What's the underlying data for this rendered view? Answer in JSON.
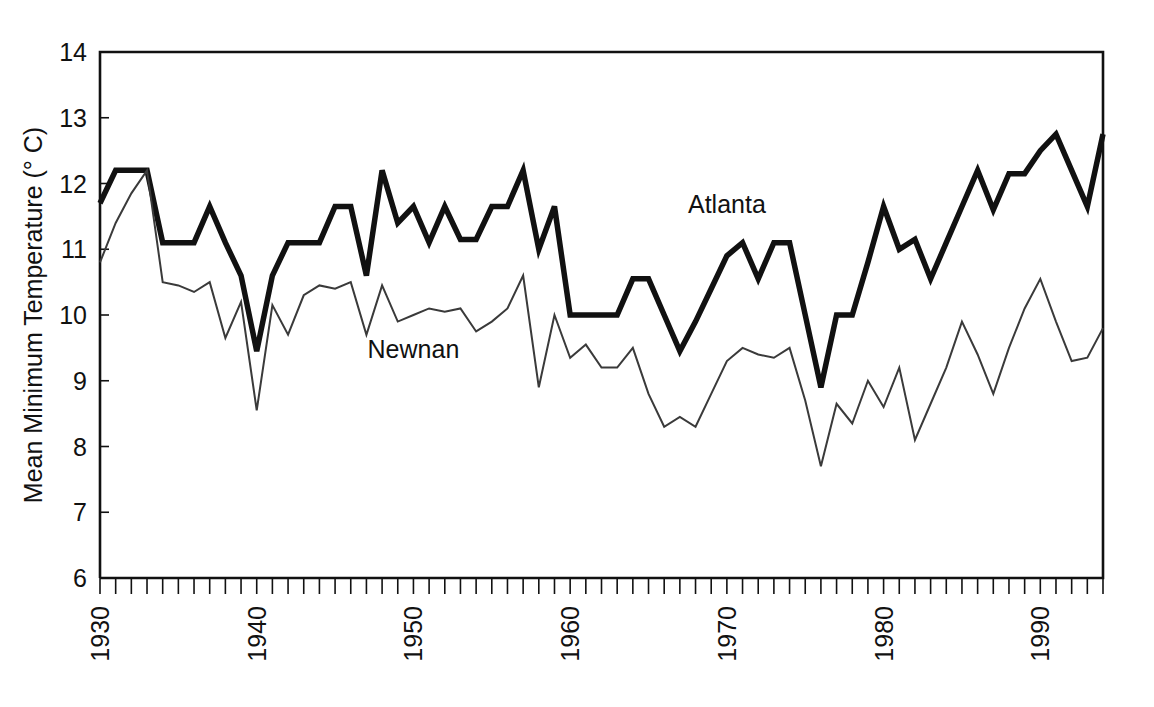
{
  "chart_data": {
    "type": "line",
    "title": "",
    "xlabel": "",
    "ylabel": "Mean Minimum Temperature (° C)",
    "ylim": [
      6,
      14
    ],
    "xlim": [
      1930,
      1994
    ],
    "yticks": [
      6,
      7,
      8,
      9,
      10,
      11,
      12,
      13,
      14
    ],
    "ytick_labels": [
      "6",
      "7",
      "8",
      "9",
      "10",
      "11",
      "12",
      "13",
      "14"
    ],
    "xticks": [
      1930,
      1940,
      1950,
      1960,
      1970,
      1980,
      1990
    ],
    "xtick_labels": [
      "1930",
      "1940",
      "1950",
      "1960",
      "1970",
      "1980",
      "1990"
    ],
    "minor_xtick_step": 1,
    "grid": false,
    "legend_position": "inline-annotation",
    "x": [
      1930,
      1931,
      1932,
      1933,
      1934,
      1935,
      1936,
      1937,
      1938,
      1939,
      1940,
      1941,
      1942,
      1943,
      1944,
      1945,
      1946,
      1947,
      1948,
      1949,
      1950,
      1951,
      1952,
      1953,
      1954,
      1955,
      1956,
      1957,
      1958,
      1959,
      1960,
      1961,
      1962,
      1963,
      1964,
      1965,
      1966,
      1967,
      1968,
      1969,
      1970,
      1971,
      1972,
      1973,
      1974,
      1975,
      1976,
      1977,
      1978,
      1979,
      1980,
      1981,
      1982,
      1983,
      1984,
      1985,
      1986,
      1987,
      1988,
      1989,
      1990,
      1991,
      1992,
      1993,
      1994
    ],
    "series": [
      {
        "name": "Atlanta",
        "color": "#111111",
        "line_width": 5.5,
        "label_x": 1970,
        "label_y": 11.55,
        "values": [
          11.7,
          12.2,
          12.2,
          12.2,
          11.1,
          11.1,
          11.1,
          11.65,
          11.1,
          10.6,
          9.45,
          10.6,
          11.1,
          11.1,
          11.1,
          11.65,
          11.65,
          10.6,
          12.2,
          11.4,
          11.65,
          11.1,
          11.65,
          11.15,
          11.15,
          11.65,
          11.65,
          12.2,
          11.0,
          11.65,
          10.0,
          10.0,
          10.0,
          10.0,
          10.55,
          10.55,
          10.0,
          9.45,
          9.9,
          10.4,
          10.9,
          11.1,
          10.55,
          11.1,
          11.1,
          10.0,
          8.9,
          10.0,
          10.0,
          10.8,
          11.65,
          11.0,
          11.15,
          10.55,
          11.1,
          11.65,
          12.2,
          11.6,
          12.15,
          12.15,
          12.5,
          12.75,
          12.2,
          11.65,
          12.75
        ]
      },
      {
        "name": "Newnan",
        "color": "#3a3a3a",
        "line_width": 2.0,
        "label_x": 1950,
        "label_y": 9.35,
        "values": [
          10.8,
          11.4,
          11.85,
          12.2,
          10.5,
          10.45,
          10.35,
          10.5,
          9.65,
          10.2,
          8.55,
          10.15,
          9.7,
          10.3,
          10.45,
          10.4,
          10.5,
          9.7,
          10.45,
          9.9,
          10.0,
          10.1,
          10.05,
          10.1,
          9.75,
          9.9,
          10.1,
          10.6,
          8.9,
          10.0,
          9.35,
          9.55,
          9.2,
          9.2,
          9.5,
          8.8,
          8.3,
          8.45,
          8.3,
          8.8,
          9.3,
          9.5,
          9.4,
          9.35,
          9.5,
          8.7,
          7.7,
          8.65,
          8.35,
          9.0,
          8.6,
          9.2,
          8.1,
          8.65,
          9.2,
          9.9,
          9.4,
          8.8,
          9.5,
          10.1,
          10.55,
          9.9,
          9.3,
          9.35,
          9.8
        ]
      }
    ]
  },
  "plot_geometry": {
    "left": 100,
    "right": 1103,
    "top": 52,
    "bottom": 578
  }
}
